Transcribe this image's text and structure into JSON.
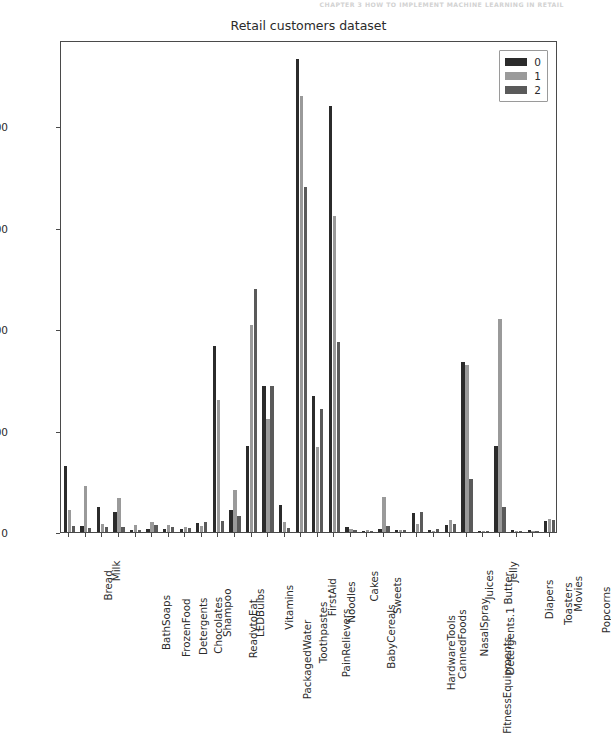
{
  "page": {
    "running_header": "CHAPTER 3    HOW TO IMPLEMENT MACHINE LEARNING IN RETAIL"
  },
  "chart_data": {
    "type": "bar",
    "title": "Retail customers dataset",
    "xlabel": "",
    "ylabel": "",
    "ylim": [
      0,
      97000
    ],
    "yticks": [
      0,
      20000,
      40000,
      60000,
      80000
    ],
    "ytick_labels": [
      "0",
      "20000",
      "40000",
      "60000",
      "80000"
    ],
    "grid": false,
    "legend_position": "upper right",
    "colors": {
      "series_0": "#2b2b2b",
      "series_1": "#9a9a9a",
      "series_2": "#5a5a5a",
      "axes": "#4a4a4a",
      "text": "#2b2b2b",
      "background": "#ffffff"
    },
    "categories": [
      "Bread",
      "Milk",
      "BathSoaps",
      "FrozenFood",
      "Detergents",
      "Chocolates",
      "Shampoo",
      "ReadytoEat",
      "LEDBulbs",
      "PackagedWater",
      "Vitamins",
      "Toothpastes",
      "PainRelievers",
      "FirstAid",
      "Noodles",
      "BabyCereals",
      "Cakes",
      "Sweets",
      "HardwareTools",
      "CannedFoods",
      "FitnessEquipments",
      "NasalSpray",
      "Detergents.1",
      "Juices",
      "Butter",
      "Jelly",
      "Diapers",
      "Toasters",
      "Movies",
      "Popcorns"
    ],
    "series": [
      {
        "name": "0",
        "color": "#2b2b2b",
        "values": [
          13000,
          1200,
          4900,
          3900,
          400,
          600,
          600,
          500,
          1800,
          36700,
          4300,
          17000,
          28700,
          5300,
          93200,
          26800,
          83900,
          900,
          200,
          500,
          300,
          3800,
          300,
          1400,
          33500,
          200,
          17000,
          300,
          300,
          2200
        ]
      },
      {
        "name": "1",
        "color": "#9a9a9a",
        "values": [
          4400,
          9000,
          1500,
          6800,
          1300,
          1900,
          1400,
          1000,
          1200,
          26000,
          8200,
          40800,
          22200,
          1900,
          86000,
          16800,
          62300,
          500,
          300,
          6900,
          400,
          1600,
          200,
          2300,
          33000,
          100,
          42000,
          200,
          200,
          2500
        ]
      },
      {
        "name": "2",
        "color": "#5a5a5a",
        "values": [
          1100,
          800,
          1000,
          900,
          300,
          1400,
          900,
          700,
          2000,
          2200,
          3100,
          48000,
          28800,
          800,
          68000,
          24300,
          37500,
          400,
          200,
          1100,
          300,
          4000,
          600,
          1600,
          10500,
          100,
          5000,
          200,
          200,
          2300
        ]
      }
    ],
    "legend": [
      {
        "label": "0",
        "color": "#2b2b2b"
      },
      {
        "label": "1",
        "color": "#9a9a9a"
      },
      {
        "label": "2",
        "color": "#5a5a5a"
      }
    ]
  }
}
